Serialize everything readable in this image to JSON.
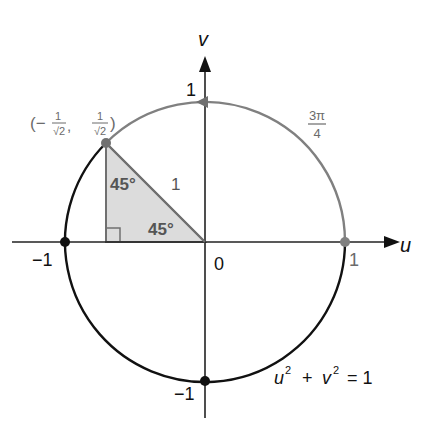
{
  "diagram": {
    "axes": {
      "u_label": "u",
      "v_label": "v",
      "origin_label": "0",
      "u_pos_tick": "1",
      "u_neg_tick": "−1",
      "v_pos_tick": "1",
      "v_neg_tick": "−1"
    },
    "circle": {
      "equation_u": "u",
      "equation_exp1": "2",
      "equation_plus": "+",
      "equation_v": "v",
      "equation_exp2": "2",
      "equation_eq": "= 1",
      "arc_color_traversed": "#808080",
      "arc_color_rest": "#111111"
    },
    "point": {
      "label_open": "(−",
      "label_num1": "1",
      "label_den1": "√2",
      "label_comma": ",",
      "label_num2": "1",
      "label_den2": "√2",
      "label_close": ")",
      "color": "#707070"
    },
    "angle_label": {
      "numerator": "3π",
      "denominator": "4"
    },
    "triangle": {
      "angle_top": "45°",
      "angle_bottom": "45°",
      "hypotenuse": "1",
      "fill": "#d9d9d9"
    }
  }
}
